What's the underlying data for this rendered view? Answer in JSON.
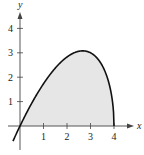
{
  "chart_data": {
    "type": "area",
    "title": "",
    "xlabel": "x",
    "ylabel": "y",
    "x_ticks": [
      "1",
      "2",
      "3",
      "4"
    ],
    "y_ticks": [
      "1",
      "2",
      "3",
      "4"
    ],
    "xlim": [
      -0.8,
      5
    ],
    "ylim": [
      -0.7,
      4.6
    ],
    "grid": false,
    "legend": null,
    "series": [
      {
        "name": "y = x·sqrt(4 − x)",
        "x": [
          -0.3,
          0,
          0.5,
          1,
          1.5,
          2,
          2.5,
          2.67,
          3,
          3.5,
          3.8,
          4
        ],
        "y": [
          -0.66,
          0,
          0.94,
          1.73,
          2.37,
          2.83,
          3.06,
          3.08,
          3.0,
          2.47,
          1.7,
          0
        ]
      }
    ],
    "shaded_region": {
      "from_x": 0,
      "to_x": 4,
      "fill": "#e6e6e6"
    },
    "colors": {
      "curve": "#111111",
      "fill": "#e6e6e6",
      "axes": "#444444"
    }
  }
}
